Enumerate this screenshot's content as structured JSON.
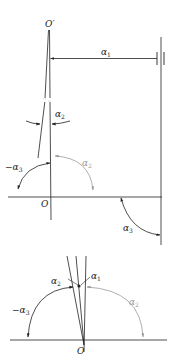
{
  "diagram": {
    "colors": {
      "line": "#222222",
      "gray_arc": "#9a9a9a",
      "background": "#ffffff"
    },
    "top_figure": {
      "labels": {
        "o_prime": "O′",
        "origin": "O",
        "alpha1": {
          "base": "α",
          "sub": "1"
        },
        "alpha2": {
          "base": "α",
          "sub": "2"
        },
        "neg_alpha3": {
          "base": "−α",
          "sub": "3"
        },
        "alpha2_gray": {
          "base": "α",
          "sub": "2"
        },
        "alpha3": {
          "base": "α",
          "sub": "3"
        }
      }
    },
    "bottom_figure": {
      "labels": {
        "origin": "O",
        "alpha1": {
          "base": "α",
          "sub": "1"
        },
        "alpha2": {
          "base": "α",
          "sub": "2"
        },
        "neg_alpha3": {
          "base": "−α",
          "sub": "3"
        },
        "alpha2_gray": {
          "base": "α",
          "sub": "2"
        }
      }
    }
  }
}
